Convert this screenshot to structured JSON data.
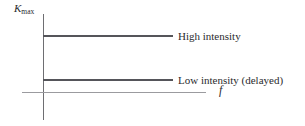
{
  "chart_data": {
    "type": "line",
    "title": "",
    "xlabel": "f",
    "ylabel": "K_max",
    "ylabel_symbol": "K",
    "ylabel_subscript": "max",
    "grid": false,
    "legend_position": "right-inline",
    "axis_ticks": false,
    "series": [
      {
        "name": "High intensity",
        "label": "High intensity",
        "type": "horizontal-line",
        "value": 2.0,
        "x_start": 0,
        "x_end": 1.0,
        "color": "#55555a"
      },
      {
        "name": "Low intensity (delayed)",
        "label": "Low intensity (delayed)",
        "type": "horizontal-line",
        "value": 0.35,
        "x_start": 0,
        "x_end": 1.0,
        "color": "#55555a"
      }
    ],
    "xlim": [
      0,
      1.3
    ],
    "ylim": [
      0,
      2.7
    ]
  },
  "figure": {
    "y_axis_label_symbol": "K",
    "y_axis_label_subscript": "max",
    "x_axis_label": "f",
    "series_high_label": "High intensity",
    "series_low_label": "Low intensity (delayed)"
  },
  "colors": {
    "axis_vertical": "#6e6e72",
    "axis_horizontal": "#9b9b9f",
    "series": "#55555a",
    "text": "#2b2b2e",
    "background": "#ffffff"
  }
}
